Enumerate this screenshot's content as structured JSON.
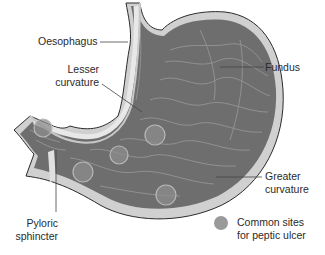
{
  "diagram": {
    "labels": {
      "oesophagus": "Oesophagus",
      "lesser_curvature_1": "Lesser",
      "lesser_curvature_2": "curvature",
      "fundus": "Fundus",
      "greater_curvature_1": "Greater",
      "greater_curvature_2": "curvature",
      "pyloric_sphincter_1": "Pyloric",
      "pyloric_sphincter_2": "sphincter"
    },
    "legend": {
      "line1": "Common sites",
      "line2": "for peptic ulcer",
      "marker_color": "#9a9a9a"
    },
    "colors": {
      "wall_outer": "#c8c8c8",
      "wall_inner": "#e8e8e8",
      "mucosa": "#6e6e6e",
      "rugae": "#9a9a9a",
      "outline": "#2a2a2a",
      "ulcer_fill": "#8e8e8e",
      "ulcer_stroke": "#b8b8b8"
    },
    "ulcer_sites_count": 5
  }
}
